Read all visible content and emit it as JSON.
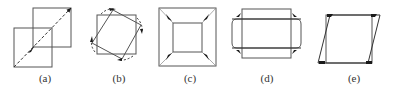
{
  "figure": {
    "stroke_color": "#555555",
    "arrow_color": "#1a1a1a",
    "panels": [
      {
        "id": "a",
        "label": "(a)",
        "label_x": 45,
        "description": "Two overlapping squares offset diagonally with a dashed diagonal translation arrow"
      },
      {
        "id": "b",
        "label": "(b)",
        "label_x": 119,
        "description": "Square and a rotated square with curved dashed rotation arrows"
      },
      {
        "id": "c",
        "label": "(c)",
        "label_x": 190,
        "description": "Outer square shrinking to inner square with four corner arrows pointing inward"
      },
      {
        "id": "d",
        "label": "(d)",
        "label_x": 267,
        "description": "Tall rectangle and wide rectangle with curved corner arrows (aspect change)"
      },
      {
        "id": "e",
        "label": "(e)",
        "label_x": 354,
        "description": "Rectangle and sheared parallelogram with corner markers (shear)"
      }
    ]
  }
}
